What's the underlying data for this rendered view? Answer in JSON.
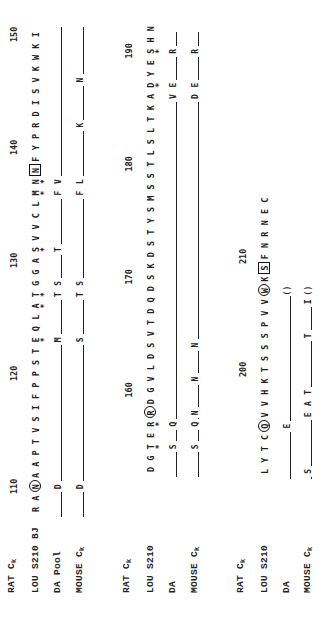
{
  "figure": {
    "type": "protein sequence alignment (kappa light chain constant region)",
    "orientation": "rotated 90 degrees counter-clockwise"
  },
  "blocks": [
    {
      "labels": [
        "RAT Cκ",
        "LOU S210 BJ",
        "DA Pool",
        "MOUSE Cκ"
      ],
      "label_parts": [
        {
          "main": "RAT C",
          "sub": "k"
        },
        {
          "main": "LOU S210 BJ",
          "sub": ""
        },
        {
          "main": "DA Pool",
          "sub": ""
        },
        {
          "main": "MOUSE C",
          "sub": "k"
        }
      ],
      "positions": [
        {
          "label": "110",
          "index": 2
        },
        {
          "label": "120",
          "index": 12
        },
        {
          "label": "130",
          "index": 22
        },
        {
          "label": "140",
          "index": 32
        },
        {
          "label": "150",
          "index": 42
        }
      ],
      "reference_sequence": [
        "R",
        "A",
        "N",
        "A",
        "A",
        "P",
        "T",
        "V",
        "S",
        "I",
        "F",
        "P",
        "P",
        "S",
        "T",
        "E",
        "Q",
        "L",
        "A",
        "T",
        "G",
        "G",
        "A",
        "S",
        "V",
        "V",
        "C",
        "L",
        "M",
        "N",
        "N",
        "F",
        "Y",
        "P",
        "R",
        "D",
        "I",
        "S",
        "V",
        "K",
        "W",
        "K",
        "I"
      ],
      "circled": [
        2
      ],
      "boxed": [
        30
      ],
      "stars": [
        15,
        18,
        19,
        23,
        28,
        29
      ],
      "variants": {
        "DA Pool": [
          {
            "index": 2,
            "res": "D"
          },
          {
            "index": 15,
            "res": "M"
          },
          {
            "index": 19,
            "res": "T"
          },
          {
            "index": 20,
            "res": "S"
          },
          {
            "index": 23,
            "res": "T"
          },
          {
            "index": 28,
            "res": "F"
          },
          {
            "index": 29,
            "res": "V"
          }
        ],
        "MOUSE Cκ": [
          {
            "index": 2,
            "res": "D"
          },
          {
            "index": 15,
            "res": "S"
          },
          {
            "index": 19,
            "res": "T"
          },
          {
            "index": 20,
            "res": "S"
          },
          {
            "index": 28,
            "res": "F"
          },
          {
            "index": 29,
            "res": "L"
          },
          {
            "index": 34,
            "res": "K"
          },
          {
            "index": 38,
            "res": "N"
          }
        ]
      },
      "line_end": 43
    },
    {
      "labels": [
        "RAT Cκ",
        "LOU S210",
        "DA",
        "MOUSE Cκ"
      ],
      "label_parts": [
        {
          "main": "RAT C",
          "sub": "k"
        },
        {
          "main": "LOU S210",
          "sub": ""
        },
        {
          "main": "DA",
          "sub": ""
        },
        {
          "main": "MOUSE C",
          "sub": "k"
        }
      ],
      "positions": [
        {
          "label": "160",
          "index": 7
        },
        {
          "label": "170",
          "index": 17
        },
        {
          "label": "180",
          "index": 27
        },
        {
          "label": "190",
          "index": 37
        }
      ],
      "reference_sequence": [
        "D",
        "G",
        "T",
        "E",
        "R",
        "R",
        "D",
        "G",
        "V",
        "L",
        "D",
        "S",
        "V",
        "T",
        "D",
        "Q",
        "D",
        "S",
        "K",
        "D",
        "S",
        "T",
        "Y",
        "S",
        "M",
        "S",
        "S",
        "T",
        "L",
        "S",
        "L",
        "T",
        "K",
        "A",
        "D",
        "Y",
        "E",
        "S",
        "H",
        "N"
      ],
      "circled": [
        5
      ],
      "boxed": [],
      "stars": [
        2,
        4,
        34,
        37
      ],
      "variants": {
        "DA": [
          {
            "index": 2,
            "res": "S"
          },
          {
            "index": 4,
            "res": "Q"
          },
          {
            "index": 33,
            "res": "V"
          },
          {
            "index": 34,
            "res": "E"
          },
          {
            "index": 37,
            "res": "R"
          }
        ],
        "MOUSE Cκ": [
          {
            "index": 2,
            "res": "S"
          },
          {
            "index": 4,
            "res": "Q"
          },
          {
            "index": 5,
            "res": "N"
          },
          {
            "index": 8,
            "res": "N"
          },
          {
            "index": 11,
            "res": "N"
          },
          {
            "index": 33,
            "res": "D"
          },
          {
            "index": 34,
            "res": "E"
          },
          {
            "index": 37,
            "res": "R"
          }
        ]
      },
      "line_end": 39
    },
    {
      "labels": [
        "RAT Cκ",
        "LOU S210",
        "DA",
        "MOUSE Cκ"
      ],
      "label_parts": [
        {
          "main": "RAT C",
          "sub": "k"
        },
        {
          "main": "LOU S210",
          "sub": ""
        },
        {
          "main": "DA",
          "sub": ""
        },
        {
          "main": "MOUSE C",
          "sub": "k"
        }
      ],
      "positions": [
        {
          "label": "200",
          "index": 9
        },
        {
          "label": "210",
          "index": 19
        }
      ],
      "reference_sequence": [
        "L",
        "Y",
        "T",
        "C",
        "Q",
        "V",
        "V",
        "H",
        "K",
        "T",
        "S",
        "S",
        "S",
        "P",
        "V",
        "V",
        "W",
        "K",
        "S",
        "F",
        "N",
        "R",
        "N",
        "E",
        "C"
      ],
      "circled": [
        4,
        16
      ],
      "boxed": [
        18
      ],
      "stars": [],
      "variants": {
        "DA": [
          {
            "index": 4,
            "res": "E"
          },
          {
            "index": 16,
            "res": "()"
          }
        ],
        "MOUSE Cκ": [
          {
            "index": 0,
            "res": "S"
          },
          {
            "index": 5,
            "res": "E"
          },
          {
            "index": 6,
            "res": "A"
          },
          {
            "index": 7,
            "res": "T"
          },
          {
            "index": 12,
            "res": "T"
          },
          {
            "index": 15,
            "res": "I"
          },
          {
            "index": 16,
            "res": "()"
          }
        ]
      },
      "line_end": 16
    }
  ]
}
